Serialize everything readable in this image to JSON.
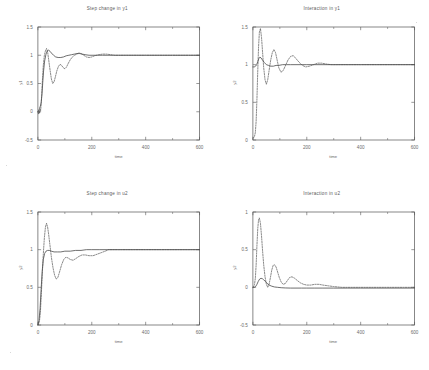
{
  "figure": {
    "background": "#ffffff",
    "ink_color": "#4a4a4a",
    "axis_color": "#555555"
  },
  "chart_data": [
    {
      "type": "line",
      "panel": "top-left",
      "title": "Step change in y1",
      "xlabel": "time",
      "ylabel": "y1",
      "xlim": [
        0,
        600
      ],
      "ylim": [
        -0.5,
        1.5
      ],
      "xticks": [
        0,
        200,
        400,
        600
      ],
      "yticks": [
        -0.5,
        0,
        0.5,
        1,
        1.5
      ],
      "xtick_labels": [
        "0",
        "200",
        "400",
        "600"
      ],
      "ytick_labels": [
        "-0.5",
        "0",
        "0.5",
        "1",
        "1.5"
      ],
      "grid": false,
      "legend": "none",
      "series": [
        {
          "name": "solid-response",
          "style": "solid",
          "x": [
            0,
            3,
            6,
            9,
            12,
            15,
            18,
            21,
            25,
            30,
            35,
            40,
            45,
            50,
            58,
            66,
            75,
            85,
            95,
            105,
            115,
            125,
            135,
            145,
            155,
            165,
            175,
            190,
            205,
            220,
            240,
            260,
            280,
            300,
            330,
            360,
            400,
            450,
            500,
            560,
            600
          ],
          "y": [
            0,
            0.02,
            0.06,
            0.1,
            0.16,
            0.3,
            0.52,
            0.72,
            0.9,
            1.02,
            1.08,
            1.09,
            1.07,
            1.04,
            1.0,
            0.97,
            0.96,
            0.96,
            0.97,
            0.99,
            1.0,
            1.01,
            1.02,
            1.03,
            1.03,
            1.02,
            1.01,
            1.0,
            1.0,
            1.0,
            1.0,
            1.0,
            1.0,
            1.0,
            1.0,
            1.0,
            1.0,
            1.0,
            1.0,
            1.0,
            1.0
          ]
        },
        {
          "name": "dashed-response",
          "style": "dashed",
          "x": [
            0,
            2,
            4,
            6,
            8,
            10,
            12,
            14,
            17,
            20,
            24,
            28,
            32,
            36,
            40,
            45,
            50,
            55,
            60,
            65,
            70,
            76,
            82,
            88,
            94,
            100,
            106,
            112,
            120,
            128,
            136,
            144,
            152,
            160,
            170,
            180,
            190,
            200,
            210,
            225,
            240,
            255,
            270,
            285,
            300,
            320,
            340,
            370,
            400,
            450,
            500,
            560,
            600
          ],
          "y": [
            0,
            -0.04,
            0.03,
            -0.03,
            0.05,
            0.02,
            0.12,
            0.3,
            0.58,
            0.82,
            1.0,
            1.08,
            1.12,
            1.06,
            0.92,
            0.74,
            0.58,
            0.5,
            0.53,
            0.62,
            0.72,
            0.8,
            0.84,
            0.82,
            0.78,
            0.76,
            0.79,
            0.85,
            0.92,
            0.97,
            1.0,
            1.02,
            1.04,
            1.03,
            1.0,
            0.97,
            0.96,
            0.97,
            0.99,
            1.01,
            1.02,
            1.02,
            1.01,
            1.0,
            1.0,
            1.0,
            1.0,
            1.0,
            1.0,
            1.0,
            1.0,
            1.0,
            1.0
          ]
        }
      ]
    },
    {
      "type": "line",
      "panel": "top-right",
      "title": "Interaction in y1",
      "xlabel": "time",
      "ylabel": "y2",
      "xlim": [
        0,
        600
      ],
      "ylim": [
        0,
        1.5
      ],
      "xticks": [
        0,
        200,
        400,
        600
      ],
      "yticks": [
        0,
        0.5,
        1,
        1.5
      ],
      "xtick_labels": [
        "0",
        "200",
        "400",
        "600"
      ],
      "ytick_labels": [
        "0",
        "0.5",
        "1",
        "1.5"
      ],
      "grid": false,
      "legend": "none",
      "series": [
        {
          "name": "solid-response",
          "style": "solid",
          "x": [
            0,
            5,
            10,
            14,
            18,
            22,
            26,
            30,
            36,
            42,
            50,
            58,
            66,
            76,
            86,
            96,
            110,
            125,
            140,
            160,
            180,
            200,
            230,
            260,
            300,
            350,
            400,
            460,
            520,
            600
          ],
          "y": [
            0.97,
            0.97,
            0.98,
            1.0,
            1.04,
            1.08,
            1.1,
            1.09,
            1.06,
            1.03,
            1.0,
            0.99,
            0.98,
            0.98,
            0.99,
            0.99,
            1.0,
            1.0,
            1.0,
            1.0,
            1.0,
            1.0,
            1.0,
            1.0,
            1.0,
            1.0,
            1.0,
            1.0,
            1.0,
            1.0
          ]
        },
        {
          "name": "dashed-response",
          "style": "dashed",
          "x": [
            0,
            3,
            6,
            9,
            12,
            15,
            18,
            21,
            24,
            28,
            32,
            36,
            40,
            45,
            50,
            55,
            60,
            66,
            72,
            78,
            84,
            90,
            96,
            104,
            112,
            120,
            130,
            140,
            150,
            160,
            172,
            184,
            196,
            210,
            225,
            240,
            255,
            270,
            290,
            310,
            330,
            360,
            400,
            450,
            500,
            560,
            600
          ],
          "y": [
            0.02,
            0.03,
            0.05,
            0.1,
            0.25,
            0.55,
            0.92,
            1.24,
            1.43,
            1.48,
            1.36,
            1.16,
            0.96,
            0.8,
            0.74,
            0.8,
            0.92,
            1.06,
            1.16,
            1.2,
            1.16,
            1.06,
            0.96,
            0.9,
            0.92,
            0.98,
            1.06,
            1.11,
            1.12,
            1.08,
            1.03,
            0.99,
            0.97,
            0.98,
            1.0,
            1.02,
            1.02,
            1.01,
            1.0,
            1.0,
            1.0,
            1.0,
            1.0,
            1.0,
            1.0,
            1.0,
            1.0
          ]
        }
      ]
    },
    {
      "type": "line",
      "panel": "bottom-left",
      "title": "Step change in u2",
      "xlabel": "time",
      "ylabel": "y2",
      "xlim": [
        0,
        600
      ],
      "ylim": [
        0,
        1.5
      ],
      "xticks": [
        0,
        200,
        400,
        600
      ],
      "yticks": [
        0,
        0.5,
        1,
        1.5
      ],
      "xtick_labels": [
        "0",
        "200",
        "400",
        "600"
      ],
      "ytick_labels": [
        "0",
        "0.5",
        "1",
        "1.5"
      ],
      "grid": false,
      "legend": "none",
      "series": [
        {
          "name": "solid-response",
          "style": "solid",
          "x": [
            0,
            4,
            8,
            12,
            16,
            20,
            25,
            30,
            36,
            42,
            50,
            60,
            72,
            85,
            100,
            120,
            140,
            160,
            180,
            200,
            230,
            260,
            300,
            350,
            400,
            460,
            520,
            600
          ],
          "y": [
            0,
            0.06,
            0.22,
            0.48,
            0.72,
            0.87,
            0.95,
            0.98,
            0.99,
            0.99,
            0.98,
            0.97,
            0.97,
            0.97,
            0.98,
            0.98,
            0.99,
            0.99,
            1.0,
            1.0,
            1.0,
            1.0,
            1.0,
            1.0,
            1.0,
            1.0,
            1.0,
            1.0
          ]
        },
        {
          "name": "dashed-response",
          "style": "dashed",
          "x": [
            0,
            3,
            6,
            9,
            12,
            16,
            20,
            24,
            28,
            32,
            36,
            40,
            45,
            50,
            56,
            62,
            68,
            74,
            80,
            88,
            96,
            104,
            112,
            120,
            130,
            140,
            152,
            164,
            176,
            190,
            205,
            220,
            235,
            250,
            262,
            275,
            290,
            310,
            330,
            360,
            400,
            450,
            500,
            560,
            600
          ],
          "y": [
            0,
            0.02,
            0.06,
            0.16,
            0.36,
            0.66,
            0.94,
            1.16,
            1.3,
            1.35,
            1.3,
            1.2,
            1.05,
            0.9,
            0.76,
            0.66,
            0.61,
            0.63,
            0.7,
            0.8,
            0.87,
            0.9,
            0.89,
            0.87,
            0.86,
            0.88,
            0.91,
            0.93,
            0.93,
            0.92,
            0.92,
            0.94,
            0.96,
            0.98,
            1.0,
            1.0,
            1.0,
            1.0,
            1.0,
            1.0,
            1.0,
            1.0,
            1.0,
            1.0,
            1.0
          ]
        }
      ]
    },
    {
      "type": "line",
      "panel": "bottom-right",
      "title": "Interaction in u2",
      "xlabel": "time",
      "ylabel": "y2",
      "xlim": [
        0,
        600
      ],
      "ylim": [
        -0.5,
        1
      ],
      "xticks": [
        0,
        200,
        400,
        600
      ],
      "yticks": [
        -0.5,
        0,
        0.5,
        1
      ],
      "xtick_labels": [
        "0",
        "200",
        "400",
        "600"
      ],
      "ytick_labels": [
        "-0.5",
        "0",
        "0.5",
        "1"
      ],
      "grid": false,
      "legend": "none",
      "series": [
        {
          "name": "solid-response",
          "style": "solid",
          "x": [
            0,
            5,
            10,
            15,
            20,
            25,
            30,
            35,
            40,
            46,
            52,
            60,
            70,
            80,
            92,
            105,
            120,
            140,
            160,
            180,
            200,
            230,
            260,
            300,
            350,
            400,
            460,
            520,
            600
          ],
          "y": [
            0,
            0.0,
            0.01,
            0.04,
            0.08,
            0.11,
            0.12,
            0.115,
            0.1,
            0.08,
            0.055,
            0.03,
            0.015,
            0.005,
            0.0,
            -0.005,
            -0.008,
            -0.01,
            -0.01,
            -0.01,
            -0.01,
            -0.01,
            -0.01,
            -0.01,
            -0.01,
            -0.01,
            -0.01,
            -0.01,
            -0.01
          ]
        },
        {
          "name": "dashed-response",
          "style": "dashed",
          "x": [
            0,
            3,
            6,
            9,
            12,
            15,
            18,
            21,
            24,
            28,
            32,
            36,
            40,
            45,
            50,
            55,
            60,
            65,
            70,
            75,
            80,
            86,
            92,
            98,
            105,
            112,
            120,
            128,
            136,
            145,
            155,
            165,
            176,
            188,
            200,
            215,
            230,
            245,
            260,
            280,
            300,
            330,
            360,
            400,
            450,
            500,
            560,
            600
          ],
          "y": [
            0.0,
            0.01,
            0.04,
            0.12,
            0.3,
            0.56,
            0.78,
            0.9,
            0.92,
            0.85,
            0.68,
            0.48,
            0.3,
            0.14,
            0.04,
            0.0,
            0.04,
            0.13,
            0.23,
            0.29,
            0.3,
            0.27,
            0.2,
            0.13,
            0.07,
            0.04,
            0.05,
            0.09,
            0.13,
            0.14,
            0.12,
            0.09,
            0.06,
            0.04,
            0.03,
            0.03,
            0.04,
            0.04,
            0.03,
            0.02,
            0.01,
            0.0,
            0.0,
            0.0,
            0.0,
            0.0,
            0.0,
            0.0
          ]
        }
      ]
    }
  ]
}
